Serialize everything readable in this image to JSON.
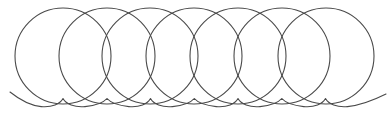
{
  "figure": {
    "kind": "geometric-diagram",
    "name": "overlapping-circles-with-wave-baseline",
    "canvas": {
      "width": 392,
      "height": 115,
      "background_color": "#ffffff"
    },
    "style": {
      "stroke_color": "#4a4a4a",
      "stroke_width": 1.1,
      "baseline_stroke_color": "#4a4a4a",
      "baseline_stroke_width": 1.1,
      "fill": "none"
    },
    "circles": {
      "count": 7,
      "radius": 48,
      "center_y": 56,
      "center_x_values": [
        63,
        107,
        150,
        194,
        238,
        282,
        326
      ],
      "spacing_x": 43.8,
      "top_y": 8,
      "bottom_y": 104,
      "left_extent_x": 15,
      "right_extent_x": 374,
      "labels": [
        "circle-1",
        "circle-2",
        "circle-3",
        "circle-4",
        "circle-5",
        "circle-6",
        "circle-7"
      ]
    },
    "baseline_wave": {
      "label": "wave-baseline",
      "start_x": 10,
      "end_x": 386,
      "crest_y": 98,
      "trough_y": 107,
      "amplitude": 4.5,
      "period": 43.8,
      "path": "M 10 92 C 20 100 30 105.5 41.2 106.6 C 52 107.6 60 104 63 98.5 C 66 104 74.5 107.6 85 106.6 C 96 105.5 104 102 107 98.5 C 110 102 118.5 105.5 128.8 106.6 C 139.5 107.6 147.5 104 150.5 98.5 C 153.5 104 162 107.6 172.5 106.6 C 183.3 105.5 191.3 102 194.3 98.5 C 197.3 102 205.8 105.5 216.2 106.6 C 227 107.6 235 104 238 98.5 C 241 104 249.5 107.6 260 106.6 C 270.8 105.5 278.8 102 281.8 98.5 C 284.8 102 293.3 105.5 303.7 106.6 C 314.5 107.6 322.5 104 325.5 98.5 C 328.5 104 337 107.6 347.5 106.6 C 358.3 105.5 370 102 386 94"
    }
  },
  "chart_data": {
    "type": "scatter",
    "title": "",
    "subtitle": "",
    "xlabel": "",
    "ylabel": "",
    "xlim": [
      0,
      392
    ],
    "ylim": [
      0,
      115
    ],
    "grid": false,
    "legend": null,
    "annotations": [],
    "series": [
      {
        "name": "circles",
        "shape": "circle",
        "radius": 48,
        "cy": 56,
        "x": [
          63,
          107,
          150,
          194,
          238,
          282,
          326
        ],
        "values": [
          56,
          56,
          56,
          56,
          56,
          56,
          56
        ]
      },
      {
        "name": "wave-baseline",
        "shape": "sinusoid",
        "period": 43.8,
        "amplitude": 4.5,
        "midline_y": 102.5,
        "x_start": 10,
        "x_end": 386
      }
    ]
  }
}
